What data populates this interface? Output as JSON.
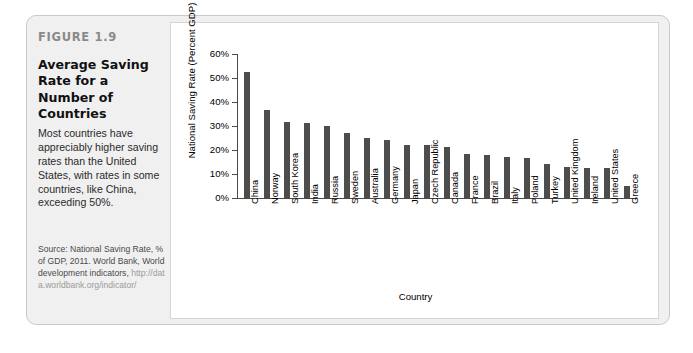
{
  "figure": {
    "kicker": "FIGURE 1.9",
    "title": "Average Saving Rate for a Number of Countries",
    "description": "Most countries have appreciably higher saving rates than the United States, with rates in some countries, like China, exceeding 50%.",
    "source_text": "Source: National Saving Rate, % of GDP, 2011. World Bank, World development indicators,",
    "source_url": "http://data.worldbank.org/indicator/"
  },
  "colors": {
    "bar": "#4d4d4d",
    "axis": "#4a4a4a",
    "panel_bg": "#ffffff",
    "frame_bg": "#f0f0f0",
    "frame_border": "#c9c9c9",
    "kicker": "#8a8a8a",
    "url": "#9b9b9b"
  },
  "chart_data": {
    "type": "bar",
    "title": "Average Saving Rate for a Number of Countries",
    "xlabel": "Country",
    "ylabel": "National Saving Rate (Percent GDP)",
    "ylim": [
      0,
      60
    ],
    "ytick_values": [
      0,
      10,
      20,
      30,
      40,
      50,
      60
    ],
    "ytick_labels": [
      "0%",
      "10%",
      "20%",
      "30%",
      "40%",
      "50%",
      "60%"
    ],
    "grid": false,
    "legend": false,
    "categories": [
      "China",
      "Norway",
      "South Korea",
      "India",
      "Russia",
      "Sweden",
      "Australia",
      "Germany",
      "Japan",
      "Czech Republic",
      "Canada",
      "France",
      "Brazil",
      "Italy",
      "Poland",
      "Turkey",
      "United Kingdom",
      "Ireland",
      "United States",
      "Greece"
    ],
    "values": [
      52.5,
      36.8,
      31.8,
      31.2,
      29.8,
      27.2,
      24.8,
      24.0,
      22.0,
      22.1,
      21.2,
      18.5,
      17.8,
      17.2,
      16.8,
      14.0,
      13.0,
      12.4,
      12.5,
      4.8
    ]
  }
}
